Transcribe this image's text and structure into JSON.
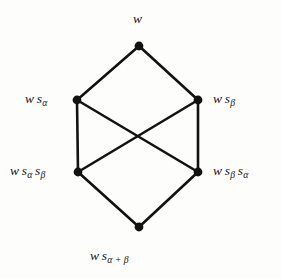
{
  "figure": {
    "background_color": "#fdfdfc",
    "stroke_color": "#121212",
    "node_color": "#121212",
    "edge_width": 2.6,
    "node_radius": 4.2
  },
  "nodes": [
    {
      "id": "top",
      "x": 139,
      "y": 46,
      "label_parts": {
        "base": "w",
        "terms": [
          "s"
        ],
        "subs": [
          "α"
        ]
      },
      "label_text": "w sα",
      "label_position": "above"
    },
    {
      "id": "left-upper",
      "x": 77,
      "y": 100,
      "label_text": "w sα",
      "label_position": "left"
    },
    {
      "id": "right-upper",
      "x": 198,
      "y": 100,
      "label_text": "w sβ",
      "label_position": "right"
    },
    {
      "id": "left-lower",
      "x": 78,
      "y": 172,
      "label_text": "w sα sβ",
      "label_position": "left"
    },
    {
      "id": "right-lower",
      "x": 198,
      "y": 172,
      "label_text": "w sβ sα",
      "label_position": "right"
    },
    {
      "id": "bottom",
      "x": 139,
      "y": 227,
      "label_text": "w sα+β",
      "label_position": "below"
    }
  ],
  "labels": {
    "top": {
      "base": "w",
      "s1": "s",
      "sub1": "α",
      "full": "w"
    },
    "left_upper": {
      "base": "w",
      "s1": "s",
      "sub1": "α"
    },
    "right_upper": {
      "base": "w",
      "s1": "s",
      "sub1": "β"
    },
    "left_lower": {
      "base": "w",
      "s1": "s",
      "sub1": "α",
      "s2": "s",
      "sub2": "β"
    },
    "right_lower": {
      "base": "w",
      "s1": "s",
      "sub1": "β",
      "s2": "s",
      "sub2": "α"
    },
    "bottom": {
      "base": "w",
      "s1": "s",
      "sub1": "α + β"
    }
  },
  "edges": [
    {
      "from": "top",
      "to": "left-upper",
      "kind": "straight"
    },
    {
      "from": "top",
      "to": "right-upper",
      "kind": "straight"
    },
    {
      "from": "left-upper",
      "to": "left-lower",
      "kind": "vertical"
    },
    {
      "from": "right-upper",
      "to": "right-lower",
      "kind": "vertical"
    },
    {
      "from": "left-upper",
      "to": "right-lower",
      "kind": "diagonal"
    },
    {
      "from": "right-upper",
      "to": "left-lower",
      "kind": "diagonal"
    },
    {
      "from": "left-lower",
      "to": "bottom",
      "kind": "straight"
    },
    {
      "from": "right-lower",
      "to": "bottom",
      "kind": "straight"
    }
  ]
}
